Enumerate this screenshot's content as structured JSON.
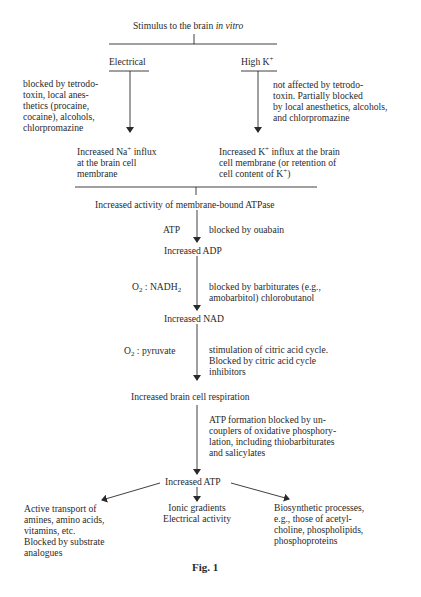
{
  "diagram": {
    "root": {
      "text_prefix": "Stimulus to the brain ",
      "text_italic": "in vitro"
    },
    "branches": {
      "electrical": {
        "label": "Electrical",
        "note": [
          "blocked by tetrodo-",
          "toxin, local anes-",
          "thetics (procaine,",
          "cocaine), alcohols,",
          "chlorpromazine"
        ],
        "result": {
          "line1_pre": "Increased Na",
          "line1_sup": "+",
          "line1_post": " influx",
          "line2": "at the brain cell",
          "line3": "membrane"
        }
      },
      "high_k": {
        "label_pre": "High K",
        "label_sup": "+",
        "note": [
          "not affected by tetrodo-",
          "toxin.  Partially blocked",
          "by local anesthetics, alcohols,",
          "and chlorpromazine"
        ],
        "result": {
          "line1_pre": "Increased K",
          "line1_sup": "+",
          "line1_post": " influx at the brain",
          "line2": "cell membrane (or retention of",
          "line3_pre": "cell content of K",
          "line3_sup": "+",
          "line3_post": ")"
        }
      }
    },
    "chain": {
      "atpase": "Increased activity of membrane-bound ATPase",
      "step1": {
        "left": "ATP",
        "right": [
          "blocked by ouabain"
        ]
      },
      "adp": "Increased ADP",
      "step2": {
        "left_pre": "O",
        "left_sub1": "2",
        "left_mid": " :  NADH",
        "left_sub2": "2",
        "right": [
          "blocked by barbiturates (e.g.,",
          "amobarbitol) chlorobutanol"
        ]
      },
      "nad": "Increased NAD",
      "step3": {
        "left_pre": "O",
        "left_sub1": "2",
        "left_mid": " :  pyruvate",
        "right": [
          "stimulation of citric acid cycle.",
          "Blocked by citric acid cycle",
          "inhibitors"
        ]
      },
      "respiration": "Increased brain cell respiration",
      "step4": {
        "right": [
          "ATP formation blocked by un-",
          "couplers of oxidative phosphory-",
          "lation, including thiobarbiturates",
          "and salicylates"
        ]
      },
      "atp": "Increased ATP"
    },
    "outputs": {
      "left": [
        "Active transport of",
        "amines, amino acids,",
        "vitamins, etc.",
        "Blocked by substrate",
        "analogues"
      ],
      "center": [
        "Ionic gradients",
        "Electrical activity"
      ],
      "right": [
        "Biosynthetic processes,",
        "e.g., those of acetyl-",
        "choline, phospholipids,",
        "phosphoproteins"
      ]
    },
    "caption": "Fig.  1"
  }
}
